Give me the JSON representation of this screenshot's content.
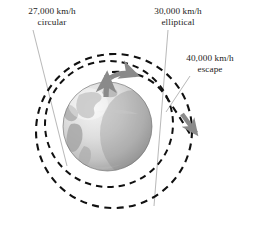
{
  "figure": {
    "background_color": "#ffffff",
    "labels": [
      {
        "id": "circular",
        "speed": "27,000 km/h",
        "kind": "circular",
        "leader_line": "from label down-right to the inner circular orbit"
      },
      {
        "id": "elliptical",
        "speed": "30,000 km/h",
        "kind": "elliptical",
        "leader_line": "from label down past the globe to the outer elliptical orbit"
      },
      {
        "id": "escape",
        "speed": "40,000 km/h",
        "kind": "escape",
        "leader_line": "from label down-left to the open escape trajectory"
      }
    ],
    "earth": {
      "name": "Earth",
      "ocean_color": "#d9d9d9",
      "land_color": "#a8a8a8",
      "shadow_color": "#8d8d8d",
      "highlight_color": "#f2f2f2",
      "outline_color": "#6e6e6e"
    },
    "orbits": {
      "dash_color": "#111111",
      "circular_label": "circular orbit",
      "elliptical_label": "elliptical orbit",
      "escape_label": "escape trajectory"
    },
    "arrows": {
      "launch_label": "launch arrow",
      "orbit_insertion_label": "orbit insertion arrow",
      "escape_label": "escape arrow",
      "color": "#8a8a8a"
    },
    "leader_color": "#9a9a9a"
  }
}
